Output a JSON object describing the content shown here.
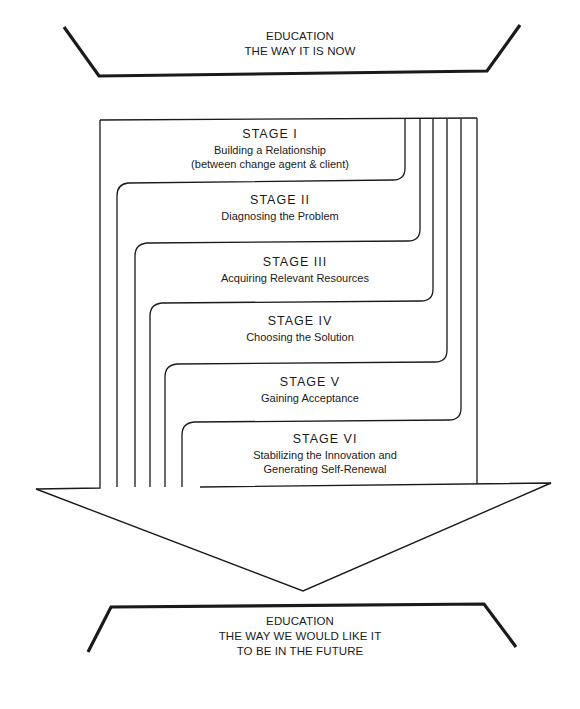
{
  "top_box": {
    "lines": [
      "EDUCATION",
      "THE WAY IT IS NOW"
    ]
  },
  "stages": [
    {
      "title": "STAGE  I",
      "lines": [
        "Building a Relationship",
        "(between change agent & client)"
      ]
    },
    {
      "title": "STAGE  II",
      "lines": [
        "Diagnosing the Problem"
      ]
    },
    {
      "title": "STAGE  III",
      "lines": [
        "Acquiring Relevant Resources"
      ]
    },
    {
      "title": "STAGE  IV",
      "lines": [
        "Choosing the Solution"
      ]
    },
    {
      "title": "STAGE  V",
      "lines": [
        "Gaining Acceptance"
      ]
    },
    {
      "title": "STAGE  VI",
      "lines": [
        "Stabilizing the Innovation and",
        "Generating Self-Renewal"
      ]
    }
  ],
  "bottom_box": {
    "lines": [
      "EDUCATION",
      "THE WAY WE WOULD LIKE IT",
      "TO BE IN THE FUTURE"
    ]
  },
  "colors": {
    "line": "#1a1a1a",
    "background": "#ffffff"
  }
}
